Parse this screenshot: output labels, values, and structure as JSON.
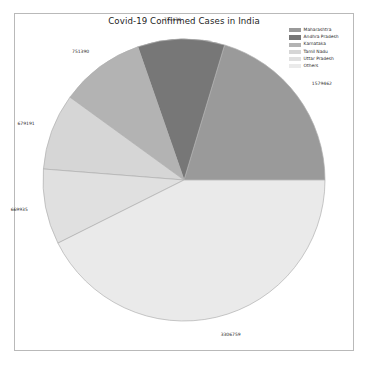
{
  "figure": {
    "background": "#ffffff",
    "border_color": "#b9b9b9"
  },
  "chart_data": {
    "type": "pie",
    "title": "Covid-19 Confirmed Cases in India",
    "xlabel": "",
    "ylabel": "",
    "categories": [
      "Maharashtra",
      "Andhra Pradesh",
      "Karnataka",
      "Tamil Nadu",
      "Uttar Pradesh",
      "Others"
    ],
    "values": [
      1579462,
      773470,
      751390,
      679191,
      669935,
      3306759
    ],
    "labels": [
      "1579462",
      "773470",
      "751390",
      "679191",
      "669935",
      "3306759"
    ],
    "colors": [
      "#9a9a9a",
      "#777777",
      "#b3b3b3",
      "#d6d6d6",
      "#e0e0e0",
      "#eaeaea"
    ],
    "edge_color": "#b0b0b0",
    "total": 7760207,
    "start_angle": 0,
    "direction": "counterclockwise",
    "legend_position": "upper right",
    "grid": false
  },
  "legend": {
    "entries": [
      {
        "label": "Maharashtra",
        "color": "#9a9a9a"
      },
      {
        "label": "Andhra Pradesh",
        "color": "#777777"
      },
      {
        "label": "Karnataka",
        "color": "#b3b3b3"
      },
      {
        "label": "Tamil Nadu",
        "color": "#d6d6d6"
      },
      {
        "label": "Uttar Pradesh",
        "color": "#e0e0e0"
      },
      {
        "label": "Others",
        "color": "#eaeaea"
      }
    ]
  }
}
